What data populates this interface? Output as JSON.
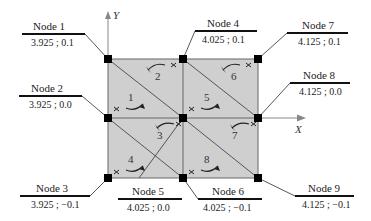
{
  "axes": {
    "x_label": "X",
    "y_label": "Y"
  },
  "colors": {
    "mesh_fill": "#cfcfcf",
    "mesh_line": "#555555",
    "node": "#000000",
    "text": "#222222"
  },
  "nodes": [
    {
      "title": "Node 1",
      "coord": "3.925 ; 0.1"
    },
    {
      "title": "Node 2",
      "coord": "3.925 ; 0.0"
    },
    {
      "title": "Node 3",
      "coord": "3.925 ; −0.1"
    },
    {
      "title": "Node 4",
      "coord": "4.025 ; 0.1"
    },
    {
      "title": "Node 5",
      "coord": "4.025 ; 0.0"
    },
    {
      "title": "Node 6",
      "coord": "4.025 ; −0.1"
    },
    {
      "title": "Node 7",
      "coord": "4.125 ; 0.1"
    },
    {
      "title": "Node 8",
      "coord": "4.125 ; 0.0"
    },
    {
      "title": "Node 9",
      "coord": "4.125 ; −0.1"
    }
  ],
  "elements": [
    "1",
    "2",
    "3",
    "4",
    "5",
    "6",
    "7",
    "8"
  ]
}
